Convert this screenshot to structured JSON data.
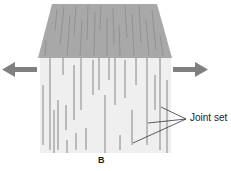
{
  "diagram": {
    "panel_label": "B",
    "callout_label": "Joint set",
    "elements": {
      "top_face": "shaded trapezoid with vertical fracture streaks",
      "front_face": "light rectangle with vertical joint lines",
      "left_arrow": "tension-arrow-left",
      "right_arrow": "tension-arrow-right"
    },
    "colors": {
      "top_face": "#a8a8a8",
      "front_face": "#efefef",
      "joint_line": "#7a7a7a",
      "arrow": "#808080",
      "leader_line": "#333333"
    }
  }
}
